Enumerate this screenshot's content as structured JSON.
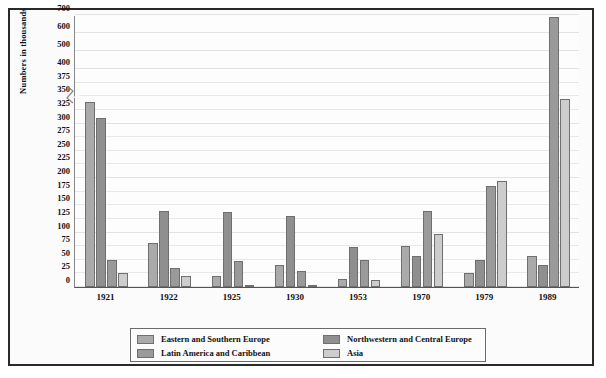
{
  "chart_data": {
    "type": "bar",
    "title": "",
    "xlabel": "",
    "ylabel": "Numbers in thousands",
    "categories": [
      "1921",
      "1922",
      "1925",
      "1930",
      "1953",
      "1970",
      "1979",
      "1989"
    ],
    "series": [
      {
        "name": "Eastern and Southern Europe",
        "color": "#aaaaaa",
        "values": [
          340,
          80,
          20,
          40,
          15,
          75,
          25,
          57
        ]
      },
      {
        "name": "Northwestern and Central Europe",
        "color": "#8f8f8f",
        "values": [
          310,
          140,
          137,
          130,
          73,
          57,
          50,
          40
        ]
      },
      {
        "name": "Latin America and Caribbean",
        "color": "#9a9a9a",
        "values": [
          50,
          35,
          47,
          30,
          50,
          140,
          185,
          690
        ]
      },
      {
        "name": "Asia",
        "color": "#cdcdcd",
        "values": [
          25,
          20,
          3,
          3,
          12,
          97,
          195,
          345
        ]
      }
    ],
    "ytick_labels": [
      "0",
      "25",
      "50",
      "75",
      "100",
      "125",
      "150",
      "175",
      "200",
      "225",
      "250",
      "275",
      "300",
      "325",
      "350",
      "375",
      "400",
      "500",
      "600",
      "700"
    ],
    "ylim": [
      0,
      700
    ],
    "axis_break": {
      "between": [
        400,
        500
      ],
      "marker": "zigzag"
    },
    "grid": true,
    "legend_position": "bottom",
    "legend_entries": [
      "Eastern and Southern Europe",
      "Northwestern and Central Europe",
      "Latin America and Caribbean",
      "Asia"
    ]
  }
}
